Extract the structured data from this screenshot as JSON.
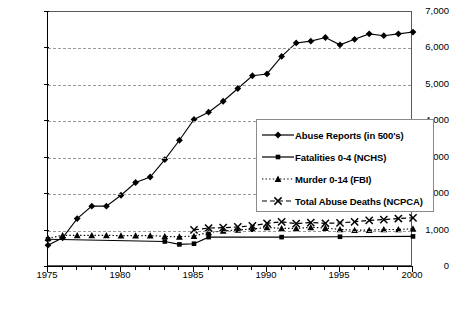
{
  "chart_data": {
    "type": "line",
    "title": "",
    "subtitle": "",
    "xlabel": "",
    "ylabel": "",
    "xlim": [
      1975,
      2000
    ],
    "ylim": [
      0,
      7000
    ],
    "grid": true,
    "legend_position": "center-right",
    "y_ticks": [
      "0",
      "1,000",
      "2,000",
      "3,000",
      "4,000",
      "5,000",
      "6,000",
      "7,000"
    ],
    "y_tick_values": [
      0,
      1000,
      2000,
      3000,
      4000,
      5000,
      6000,
      7000
    ],
    "x_ticks": [
      "1975",
      "1980",
      "1985",
      "1990",
      "1995",
      "2000"
    ],
    "x_tick_values": [
      1975,
      1980,
      1985,
      1990,
      1995,
      2000
    ],
    "x_minor_step": 1,
    "series": [
      {
        "name": "Abuse Reports (in 500's)",
        "marker": "diamond",
        "line": "solid",
        "color": "#000000",
        "x": [
          1975,
          1976,
          1977,
          1978,
          1979,
          1980,
          1981,
          1982,
          1983,
          1984,
          1985,
          1986,
          1987,
          1988,
          1989,
          1990,
          1991,
          1992,
          1993,
          1994,
          1995,
          1996,
          1997,
          1998,
          1999,
          2000
        ],
        "values": [
          600,
          800,
          1330,
          1670,
          1670,
          1970,
          2320,
          2470,
          2950,
          3480,
          4050,
          4250,
          4550,
          4900,
          5250,
          5300,
          5780,
          6150,
          6200,
          6300,
          6100,
          6250,
          6400,
          6350,
          6400,
          6450
        ]
      },
      {
        "name": "Fatalities 0-4 (NCHS)",
        "marker": "square",
        "line": "solid",
        "color": "#000000",
        "x": [
          1975,
          1983,
          1984,
          1985,
          1986,
          1991,
          1995,
          2000
        ],
        "values": [
          760,
          700,
          620,
          640,
          820,
          820,
          830,
          840
        ]
      },
      {
        "name": "Murder 0-14 (FBI)",
        "marker": "triangle",
        "line": "dotted",
        "color": "#000000",
        "x": [
          1975,
          1976,
          1977,
          1978,
          1979,
          1980,
          1981,
          1982,
          1983,
          1984,
          1985,
          1986,
          1987,
          1988,
          1989,
          1990,
          1991,
          1992,
          1993,
          1994,
          1995,
          1996,
          1997,
          1998,
          1999,
          2000
        ],
        "values": [
          790,
          870,
          870,
          870,
          870,
          860,
          860,
          860,
          840,
          830,
          850,
          950,
          990,
          1020,
          1040,
          1090,
          1060,
          1060,
          1090,
          1070,
          1030,
          1010,
          1010,
          1030,
          1030,
          1050
        ]
      },
      {
        "name": "Total Abuse Deaths (NCPCA)",
        "marker": "x",
        "line": "dashed",
        "color": "#000000",
        "x": [
          1985,
          1986,
          1987,
          1988,
          1989,
          1990,
          1991,
          1992,
          1993,
          1994,
          1995,
          1996,
          1997,
          1998,
          1999,
          2000
        ],
        "values": [
          1020,
          1070,
          1080,
          1100,
          1130,
          1200,
          1240,
          1190,
          1220,
          1200,
          1210,
          1240,
          1280,
          1300,
          1330,
          1350
        ]
      }
    ]
  },
  "legend": {
    "entries": [
      {
        "label": "Abuse Reports (in 500's)"
      },
      {
        "label": "Fatalities 0-4 (NCHS)"
      },
      {
        "label": "Murder 0-14 (FBI)"
      },
      {
        "label": "Total Abuse Deaths (NCPCA)"
      }
    ]
  }
}
